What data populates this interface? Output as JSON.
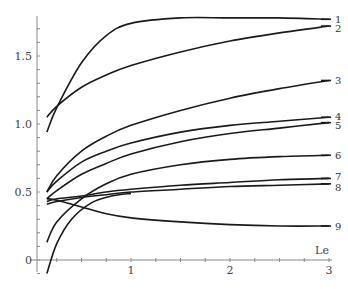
{
  "chart_data": {
    "type": "line",
    "title": "",
    "xlabel": "Le",
    "ylabel": "",
    "xlim": [
      0,
      3
    ],
    "ylim": [
      -0.1,
      1.78
    ],
    "grid": false,
    "legend": "inline labels at right end of curves",
    "x_ticks": [
      {
        "value": 1,
        "label": "1"
      },
      {
        "value": 2,
        "label": "2"
      },
      {
        "value": 3,
        "label": "3"
      }
    ],
    "y_ticks": [
      {
        "value": 0,
        "label": "0"
      },
      {
        "value": 0.5,
        "label": "0.5"
      },
      {
        "value": 1.0,
        "label": "1.0"
      },
      {
        "value": 1.5,
        "label": "1.5"
      }
    ],
    "x": [
      0.15,
      0.25,
      0.5,
      0.75,
      1.0,
      1.5,
      2.0,
      2.5,
      3.0
    ],
    "series": [
      {
        "name": "1",
        "values": [
          0.94,
          1.12,
          1.45,
          1.65,
          1.74,
          1.78,
          1.78,
          1.78,
          1.77
        ]
      },
      {
        "name": "2",
        "values": [
          1.05,
          1.13,
          1.27,
          1.36,
          1.43,
          1.53,
          1.61,
          1.67,
          1.72
        ]
      },
      {
        "name": "3",
        "values": [
          0.5,
          0.62,
          0.8,
          0.91,
          0.99,
          1.1,
          1.19,
          1.26,
          1.32
        ]
      },
      {
        "name": "4",
        "values": [
          0.5,
          0.58,
          0.72,
          0.8,
          0.86,
          0.94,
          0.99,
          1.02,
          1.05
        ]
      },
      {
        "name": "5",
        "values": [
          0.45,
          0.51,
          0.63,
          0.71,
          0.78,
          0.87,
          0.93,
          0.97,
          1.01
        ]
      },
      {
        "name": "6",
        "values": [
          0.13,
          0.28,
          0.45,
          0.56,
          0.63,
          0.7,
          0.74,
          0.76,
          0.77
        ]
      },
      {
        "name": "7",
        "values": [
          0.43,
          0.45,
          0.47,
          0.5,
          0.52,
          0.55,
          0.57,
          0.59,
          0.6
        ]
      },
      {
        "name": "8",
        "values": [
          0.41,
          0.43,
          0.46,
          0.48,
          0.5,
          0.52,
          0.54,
          0.55,
          0.56
        ]
      },
      {
        "name": "9",
        "values": [
          0.45,
          0.44,
          0.39,
          0.34,
          0.31,
          0.28,
          0.26,
          0.25,
          0.25
        ]
      }
    ],
    "extra_curve_note": "An additional steep curve rises from about -0.1 at Le=0.15 and merges toward curve 8/7 region",
    "line_color": "#1a1a1a",
    "axis_color": "#888888"
  }
}
